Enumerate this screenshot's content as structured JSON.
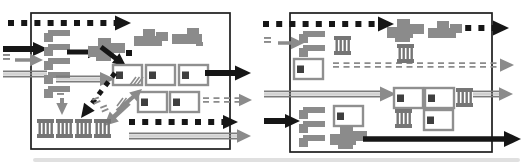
{
  "figure": {
    "colors": {
      "black": "#161616",
      "gray": "#8b8b8b",
      "grayDark": "#3f3f3f",
      "combGray": "#757575",
      "boxOutline": "#8f8f8f",
      "stripeDark": "#7c7c7c",
      "stripeLight": "#a8a8a8",
      "border": "#1d1d1d",
      "artifact": "#c6c6c6"
    },
    "glyphs": {
      "flag": {
        "bar": [
          4,
          0,
          22,
          6
        ],
        "tab": [
          0,
          3,
          9,
          9
        ]
      },
      "comb": {
        "w": 17,
        "h": 19,
        "cap": 4,
        "stripeXs": [
          1.5,
          5.5,
          9.5,
          13.5
        ],
        "stripeW": 2.4
      },
      "boxunit": {
        "w": 29,
        "h": 20,
        "strokeW": 2.4,
        "inner": [
          3,
          6.5,
          7,
          7.5
        ]
      },
      "blobVariants": {
        "a": [
          [
            9,
            0,
            12,
            8
          ],
          [
            22,
            3,
            12,
            9
          ],
          [
            0,
            7,
            28,
            10
          ]
        ],
        "b": [
          [
            15,
            0,
            12,
            8
          ],
          [
            0,
            6,
            30,
            10
          ],
          [
            24,
            14,
            7,
            4
          ]
        ],
        "c": [
          [
            10,
            0,
            13,
            9
          ],
          [
            0,
            8,
            26,
            11
          ],
          [
            20,
            5,
            17,
            10
          ],
          [
            8,
            17,
            15,
            6
          ]
        ]
      }
    },
    "artifact": {
      "x": 33,
      "y": 158,
      "w": 487,
      "h": 4
    },
    "panels": [
      {
        "name": "left-compartment",
        "box": {
          "x": 31,
          "y": 13,
          "w": 199,
          "h": 136
        },
        "elements": [
          {
            "name": "dashed-black-arrow-top",
            "type": "arrow",
            "style": "dotted",
            "color": "black",
            "from": [
              8,
              23
            ],
            "to": [
              131,
              23
            ],
            "w": 6,
            "head": 16
          },
          {
            "name": "solid-black-arrow-entry",
            "type": "arrow",
            "style": "solid",
            "color": "black",
            "from": [
              3,
              49
            ],
            "to": [
              48,
              49
            ],
            "w": 6,
            "head": 15
          },
          {
            "name": "equals-mark",
            "type": "ddashmark",
            "x": 3,
            "y": 54,
            "angle": 0
          },
          {
            "name": "gray-arrow-entry",
            "type": "arrow",
            "style": "solid",
            "color": "gray",
            "from": [
              15,
              60
            ],
            "to": [
              43,
              60
            ],
            "w": 3.5,
            "head": 13
          },
          {
            "name": "striped-gray-line-entry",
            "type": "arrow",
            "style": "striped",
            "color": "gray",
            "from": [
              3,
              74
            ],
            "to": [
              47,
              74
            ],
            "w": 6,
            "head": 0
          },
          {
            "name": "flag-shape",
            "type": "flag",
            "x": 44,
            "y": 30
          },
          {
            "name": "flag-shape",
            "type": "flag",
            "x": 44,
            "y": 44
          },
          {
            "name": "flag-shape",
            "type": "flag",
            "x": 44,
            "y": 58
          },
          {
            "name": "flag-shape",
            "type": "flag",
            "x": 44,
            "y": 72
          },
          {
            "name": "flag-shape",
            "type": "flag",
            "x": 44,
            "y": 86
          },
          {
            "name": "solid-black-arrow-internal",
            "type": "arrow",
            "style": "solid",
            "color": "black",
            "from": [
              67,
              52
            ],
            "to": [
              101,
              52
            ],
            "w": 5,
            "head": 13
          },
          {
            "name": "aggregate-blob",
            "type": "blob",
            "x": 88,
            "y": 38,
            "variant": "c"
          },
          {
            "name": "aggregate-blob",
            "type": "blob",
            "x": 134,
            "y": 29,
            "variant": "a"
          },
          {
            "name": "aggregate-blob",
            "type": "blob",
            "x": 172,
            "y": 28,
            "variant": "b"
          },
          {
            "name": "dash-dot",
            "type": "dot",
            "x": 129,
            "y": 53,
            "s": 6
          },
          {
            "name": "solid-black-arrow-diagonal",
            "type": "arrow",
            "style": "solid",
            "color": "black",
            "from": [
              101,
              47
            ],
            "to": [
              126,
              66
            ],
            "w": 5,
            "head": 13
          },
          {
            "name": "striped-gray-arrow-internal",
            "type": "arrow",
            "style": "striped",
            "color": "gray",
            "from": [
              56,
              79
            ],
            "to": [
              115,
              79
            ],
            "w": 6,
            "head": 15
          },
          {
            "name": "box-with-square-unit",
            "type": "boxunit",
            "x": 113,
            "y": 65
          },
          {
            "name": "box-with-square-unit",
            "type": "boxunit",
            "x": 146,
            "y": 65
          },
          {
            "name": "box-with-square-unit",
            "type": "boxunit",
            "x": 179,
            "y": 65
          },
          {
            "name": "solid-black-arrow-exit",
            "type": "arrow",
            "style": "solid",
            "color": "black",
            "from": [
              205,
              73
            ],
            "to": [
              251,
              73
            ],
            "w": 6,
            "head": 16
          },
          {
            "name": "box-with-square-unit",
            "type": "boxunit",
            "x": 138,
            "y": 92
          },
          {
            "name": "box-with-square-unit",
            "type": "boxunit",
            "x": 170,
            "y": 92
          },
          {
            "name": "double-dashed-gray-arrow-exit",
            "type": "arrow",
            "style": "ddash",
            "color": "gray",
            "from": [
              203,
              100
            ],
            "to": [
              252,
              100
            ],
            "w": 4,
            "head": 13
          },
          {
            "name": "equals-mark",
            "type": "ddashmark",
            "x": 57,
            "y": 89,
            "angle": 0
          },
          {
            "name": "gray-arrow-down",
            "type": "arrow",
            "style": "solid",
            "color": "gray",
            "from": [
              62,
              98
            ],
            "to": [
              62,
              115
            ],
            "w": 4,
            "head": 12
          },
          {
            "name": "dashed-black-arrow-diagonal",
            "type": "arrow",
            "style": "dotted",
            "color": "black",
            "from": [
              115,
              73
            ],
            "to": [
              81,
              118
            ],
            "w": 5,
            "head": 14
          },
          {
            "name": "equals-mark",
            "type": "ddashmark",
            "x": 92,
            "y": 99,
            "angle": -22
          },
          {
            "name": "equals-mark",
            "type": "ddashmark",
            "x": 100,
            "y": 107,
            "angle": -22
          },
          {
            "name": "gray-arrow-diagonal-down",
            "type": "arrow",
            "style": "solid",
            "color": "gray",
            "from": [
              129,
              103
            ],
            "to": [
              104,
              126
            ],
            "w": 5,
            "head": 14
          },
          {
            "name": "hatch-mark",
            "type": "hatch",
            "x": 130,
            "y": 77
          },
          {
            "name": "gray-arrow-diagonal-up",
            "type": "arrow",
            "style": "solid",
            "color": "gray",
            "from": [
              117,
              111
            ],
            "to": [
              142,
              89
            ],
            "w": 4,
            "head": 12
          },
          {
            "name": "hatch-mark",
            "type": "hatch",
            "x": 117,
            "y": 98
          },
          {
            "name": "striped-comb-shape",
            "type": "comb",
            "x": 37,
            "y": 119
          },
          {
            "name": "striped-comb-shape",
            "type": "comb",
            "x": 56,
            "y": 119
          },
          {
            "name": "striped-comb-shape",
            "type": "comb",
            "x": 75,
            "y": 119
          },
          {
            "name": "striped-comb-shape",
            "type": "comb",
            "x": 94,
            "y": 119
          },
          {
            "name": "dashed-black-arrow-exit",
            "type": "arrow",
            "style": "dotted",
            "color": "black",
            "from": [
              129,
              122
            ],
            "to": [
              238,
              122
            ],
            "w": 6,
            "head": 15
          },
          {
            "name": "striped-gray-arrow-exit",
            "type": "arrow",
            "style": "striped",
            "color": "gray",
            "from": [
              129,
              136
            ],
            "to": [
              251,
              136
            ],
            "w": 6,
            "head": 14
          }
        ]
      },
      {
        "name": "right-compartment",
        "box": {
          "x": 290,
          "y": 13,
          "w": 202,
          "h": 139
        },
        "elements": [
          {
            "name": "dashed-black-arrow-top",
            "type": "arrow",
            "style": "dotted",
            "color": "black",
            "from": [
              263,
              24
            ],
            "to": [
              394,
              24
            ],
            "w": 6,
            "head": 16
          },
          {
            "name": "dashed-black-arrow-top-exit",
            "type": "arrow",
            "style": "dotted",
            "color": "black",
            "from": [
              452,
              28
            ],
            "to": [
              509,
              28
            ],
            "w": 6,
            "head": 16
          },
          {
            "name": "equals-mark",
            "type": "ddashmark",
            "x": 264,
            "y": 37,
            "angle": 0
          },
          {
            "name": "gray-arrow-entry",
            "type": "arrow",
            "style": "solid",
            "color": "gray",
            "from": [
              278,
              43
            ],
            "to": [
              304,
              43
            ],
            "w": 3.5,
            "head": 13
          },
          {
            "name": "flag-shape",
            "type": "flag",
            "x": 299,
            "y": 31
          },
          {
            "name": "flag-shape",
            "type": "flag",
            "x": 299,
            "y": 45
          },
          {
            "name": "striped-comb-shape",
            "type": "comb",
            "x": 334,
            "y": 36
          },
          {
            "name": "box-with-square-unit",
            "type": "boxunit",
            "x": 294,
            "y": 59
          },
          {
            "name": "double-dashed-gray-arrow",
            "type": "arrow",
            "style": "ddash",
            "color": "gray",
            "from": [
              333,
              65
            ],
            "to": [
              514,
              65
            ],
            "w": 4,
            "head": 14
          },
          {
            "name": "aggregate-blob",
            "type": "blob",
            "x": 387,
            "y": 19,
            "variant": "c"
          },
          {
            "name": "aggregate-blob",
            "type": "blob",
            "x": 428,
            "y": 21,
            "variant": "a"
          },
          {
            "name": "striped-comb-shape",
            "type": "comb",
            "x": 397,
            "y": 44
          },
          {
            "name": "striped-gray-arrow-entry",
            "type": "arrow",
            "style": "striped",
            "color": "gray",
            "from": [
              264,
              94
            ],
            "to": [
              396,
              94
            ],
            "w": 6,
            "head": 16
          },
          {
            "name": "box-with-square-unit",
            "type": "boxunit",
            "x": 394,
            "y": 88
          },
          {
            "name": "box-with-square-unit",
            "type": "boxunit",
            "x": 425,
            "y": 88
          },
          {
            "name": "striped-comb-shape",
            "type": "comb",
            "x": 456,
            "y": 88
          },
          {
            "name": "striped-comb-shape",
            "type": "comb",
            "x": 395,
            "y": 109
          },
          {
            "name": "box-with-square-unit",
            "type": "boxunit",
            "x": 424,
            "y": 110
          },
          {
            "name": "striped-gray-arrow-exit",
            "type": "arrow",
            "style": "striped",
            "color": "gray",
            "from": [
              473,
              94
            ],
            "to": [
              513,
              94
            ],
            "w": 6,
            "head": 14
          },
          {
            "name": "solid-black-arrow-entry",
            "type": "arrow",
            "style": "solid",
            "color": "black",
            "from": [
              264,
              121
            ],
            "to": [
              300,
              121
            ],
            "w": 6,
            "head": 15
          },
          {
            "name": "flag-shape",
            "type": "flag",
            "x": 299,
            "y": 107
          },
          {
            "name": "flag-shape",
            "type": "flag",
            "x": 299,
            "y": 121
          },
          {
            "name": "flag-shape",
            "type": "flag",
            "x": 299,
            "y": 135
          },
          {
            "name": "box-with-square-unit",
            "type": "boxunit",
            "x": 334,
            "y": 106
          },
          {
            "name": "aggregate-blob",
            "type": "blob",
            "x": 330,
            "y": 126,
            "variant": "c"
          },
          {
            "name": "solid-black-arrow-exit",
            "type": "arrow",
            "style": "solid",
            "color": "black",
            "from": [
              363,
              139
            ],
            "to": [
              521,
              139
            ],
            "w": 5.5,
            "head": 17
          }
        ]
      }
    ]
  }
}
